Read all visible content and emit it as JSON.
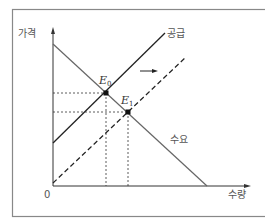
{
  "diagram": {
    "type": "supply-demand",
    "labels": {
      "y_axis": "가격",
      "x_axis": "수량",
      "origin": "0",
      "supply": "공급",
      "demand": "수요",
      "e0": "E",
      "e0_sub": "0",
      "e1": "E",
      "e1_sub": "1"
    },
    "shift_direction": "right",
    "colors": {
      "line": "#222222",
      "demand": "#555555",
      "frame": "#777777"
    }
  }
}
